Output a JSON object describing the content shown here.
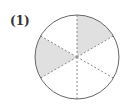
{
  "problem": {
    "label": "(1)"
  },
  "figure": {
    "shape": "circle",
    "center": [
      77,
      57
    ],
    "radius": 42,
    "divisions": 6,
    "shaded_sectors": [
      0,
      4
    ],
    "shaded_count": 2,
    "fraction": "2/6",
    "colors": {
      "outline": "#666666",
      "divider": "#888888",
      "shade": "#e0e0e0",
      "background": "#ffffff"
    }
  }
}
